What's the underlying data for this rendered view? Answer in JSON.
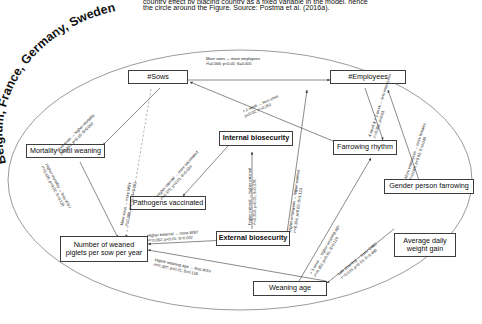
{
  "caption": {
    "line1": "country effect by placing country as a fixed variable in the model, hence",
    "line2": "the circle around the Figure. Source: Postma et al. (2016a)."
  },
  "circle_label": "Belgium, France, Germany, Sweden",
  "nodes": [
    {
      "id": "sows",
      "label": "#Sows"
    },
    {
      "id": "employees",
      "label": "#Employees"
    },
    {
      "id": "mortality",
      "label": "Mortality until weaning"
    },
    {
      "id": "internal",
      "label": "Internal biosecurity"
    },
    {
      "id": "farrowing",
      "label": "Farrowing rhythm"
    },
    {
      "id": "gender",
      "label": "Gender person farrowing"
    },
    {
      "id": "pathogens",
      "label": "Pathogens vaccinated"
    },
    {
      "id": "external",
      "label": "External biosecurity"
    },
    {
      "id": "adwg",
      "label": "Average daily weight gain"
    },
    {
      "id": "wsy",
      "label": "Number of weaned piglets per sow per year"
    },
    {
      "id": "weaning",
      "label": "Weaning age"
    }
  ],
  "edges": [
    {
      "id": "sows-employees",
      "from": "sows",
      "to": "employees",
      "text": "More sows → more employees",
      "stats": "r²=0.566; p<0.01; ß=0.005"
    },
    {
      "id": "sows-mortality",
      "from": "sows",
      "to": "mortality",
      "text": "More sows → higher mortality",
      "stats": "r²=0.353; p<0.10; ß=0.002"
    },
    {
      "id": "sows-wsy",
      "from": "sows",
      "to": "wsy",
      "text": "More sows → more WSY",
      "stats": "r²=0.389; p<0.01; ß=0.001"
    },
    {
      "id": "farrowing-sows",
      "from": "farrowing",
      "to": "sows",
      "text": "> 2 week → less sows",
      "stats": "p<0.02; r²=0.353"
    },
    {
      "id": "mortality-wsy",
      "from": "mortality",
      "to": "wsy",
      "text": "Higher mortality → less WSY",
      "stats": "r²=0.425; p<0.01; ß=0.126"
    },
    {
      "id": "internal-pathogens",
      "from": "internal",
      "to": "pathogens",
      "text": "Higher internal → more vaccinated",
      "stats": "r²=0.375; p<0.01; ß=0.024"
    },
    {
      "id": "internal-external",
      "from": "internal",
      "to": "external",
      "text": "Higher internal → higher external",
      "stats": "r²=0.354; p<0.01; ß=0.378"
    },
    {
      "id": "external-wsy",
      "from": "external",
      "to": "wsy",
      "text": "Higher external → more WSY",
      "stats": "r²=0.362; p<0.01; ß=0.002"
    },
    {
      "id": "employees-external",
      "from": "employees",
      "to": "external",
      "text": "Higher employees → higher external",
      "stats": "r²=0.354; p<0.02; ß=1.123"
    },
    {
      "id": "farrowing-employees",
      "from": "farrowing",
      "to": "employees",
      "text": "4 week & > 1 week → less employees",
      "stats": "r²=0.352; p<0.01"
    },
    {
      "id": "employees-gender",
      "from": "employees",
      "to": "gender",
      "text": "More employees → more females",
      "stats": "r²=0.046; p<0.01; ß=0.049"
    },
    {
      "id": "weaning-farrowing",
      "from": "weaning",
      "to": "farrowing",
      "text": "> 3 week → higher weaning age",
      "stats": "r²=0.362; p<0.01; ß=0.118"
    },
    {
      "id": "weaning-adwg",
      "from": "weaning",
      "to": "adwg",
      "text": "Late weaning → lower DWG",
      "stats": "r²=0.035; p<0.03; ß=0.486"
    },
    {
      "id": "weaning-wsy",
      "from": "weaning",
      "to": "wsy",
      "text": "Higher weaning age → less WSY",
      "stats": "r²=0.387; p<0.01; ß=0.118"
    }
  ],
  "colors": {
    "line": "#555555",
    "box_border": "#3d3d3d",
    "text": "#0d0d0d",
    "background": "#ffffff"
  }
}
